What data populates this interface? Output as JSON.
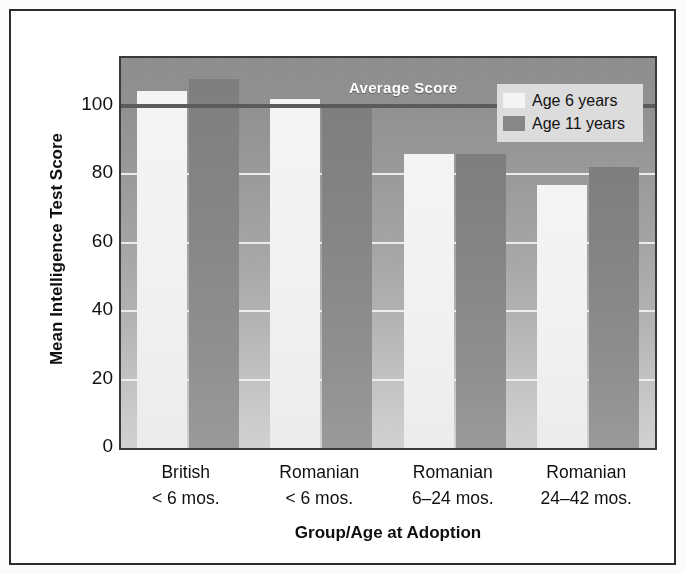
{
  "chart_data": {
    "type": "bar",
    "title": "",
    "xlabel": "Group/Age at Adoption",
    "ylabel": "Mean Intelligence Test Score",
    "categories": [
      "British\n< 6 mos.",
      "Romanian\n< 6 mos.",
      "Romanian\n6–24 mos.",
      "Romanian\n24–42 mos."
    ],
    "category_lines": [
      [
        "British",
        "< 6 mos."
      ],
      [
        "Romanian",
        "< 6 mos."
      ],
      [
        "Romanian",
        "6–24 mos."
      ],
      [
        "Romanian",
        "24–42 mos."
      ]
    ],
    "series": [
      {
        "name": "Age 6 years",
        "values": [
          104.5,
          102.0,
          86.0,
          77.0
        ],
        "color": "#f4f4f2"
      },
      {
        "name": "Age 11 years",
        "values": [
          108.0,
          100.0,
          86.0,
          82.0
        ],
        "color": "#878787"
      }
    ],
    "ylim": [
      0,
      114
    ],
    "yticks": [
      0,
      20,
      40,
      60,
      80,
      100
    ],
    "ytick_labels": [
      "0",
      "20",
      "40",
      "60",
      "80",
      "100"
    ],
    "grid": true,
    "grid_color": "#f2f2f2",
    "legend_position": "top-right",
    "annotations": [
      {
        "name": "average-score",
        "label": "Average Score",
        "value": 100,
        "line_color": "#5b5b5b",
        "text_color": "#ffffff"
      }
    ],
    "plot_background": "gray-gradient"
  },
  "legend": {
    "items": [
      {
        "label": "Age 6 years",
        "swatch": "light-swatch"
      },
      {
        "label": "Age 11 years",
        "swatch": "dark-swatch"
      }
    ]
  },
  "axes": {
    "y_title": "Mean Intelligence Test Score",
    "x_title": "Group/Age at Adoption"
  }
}
